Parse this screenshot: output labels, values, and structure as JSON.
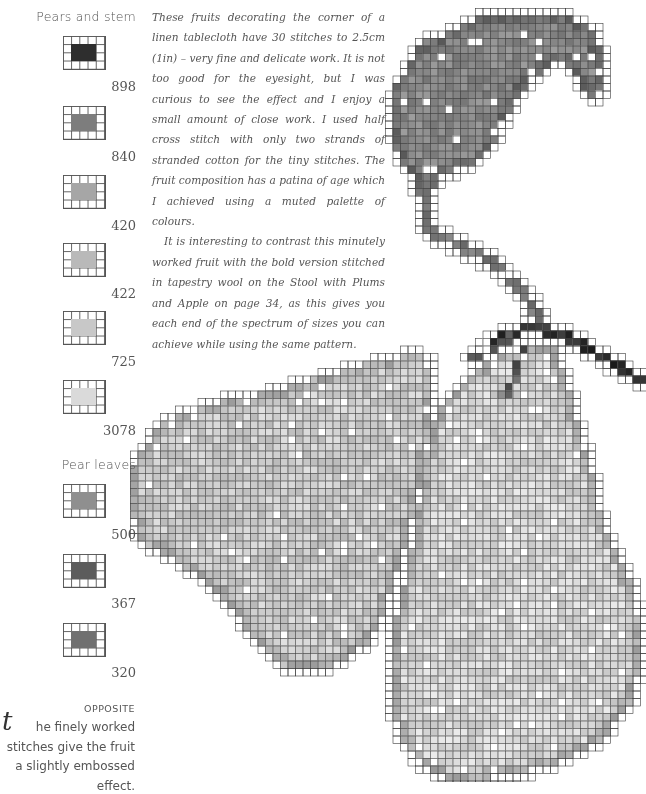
{
  "legend": {
    "sections": [
      {
        "heading": "Pears and stem",
        "swatches": [
          {
            "code": "898",
            "color": "#2e2e2e"
          },
          {
            "code": "840",
            "color": "#7d7d7d"
          },
          {
            "code": "420",
            "color": "#a6a6a6"
          },
          {
            "code": "422",
            "color": "#b9b9b9"
          },
          {
            "code": "725",
            "color": "#c8c8c8"
          },
          {
            "code": "3078",
            "color": "#dadada"
          }
        ]
      },
      {
        "heading": "Pear leaves",
        "swatches": [
          {
            "code": "500",
            "color": "#8f8f8f"
          },
          {
            "code": "367",
            "color": "#5c5c5c"
          },
          {
            "code": "320",
            "color": "#707070"
          }
        ]
      }
    ]
  },
  "body": {
    "paragraphs": [
      "These fruits decorating the corner of a linen tablecloth have 30 stitches to 2.5cm (1in) – very fine and delicate work. It is not too good for the eyesight, but I was curious to see the effect and I enjoy a small amount of close work. I used half cross stitch with only two strands of stranded cotton for the tiny stitches. The fruit composition has a patina of age which I achieved using a muted palette of colours.",
      "It is interesting to contrast this minutely worked fruit with the bold version stitched in tapestry wool on the Stool with Plums and Apple on page 34, as this gives you each end of the spectrum of sizes you can achieve while using the same pattern."
    ]
  },
  "caption": {
    "label": "OPPOSITE",
    "dropcap": "t",
    "text": "he finely worked stitches give the fruit a slightly embossed effect."
  },
  "chart": {
    "cell": 7.5,
    "grid_color": "#3a3a3a",
    "regions": [
      {
        "name": "leaf",
        "fill": "#8a8a8a",
        "dark": "#4a4a4a",
        "points": [
          [
            395,
            90
          ],
          [
            420,
            45
          ],
          [
            480,
            18
          ],
          [
            545,
            12
          ],
          [
            590,
            25
          ],
          [
            600,
            55
          ],
          [
            600,
            95
          ],
          [
            590,
            95
          ],
          [
            565,
            60
          ],
          [
            545,
            65
          ],
          [
            520,
            90
          ],
          [
            505,
            115
          ],
          [
            490,
            150
          ],
          [
            470,
            165
          ],
          [
            450,
            170
          ],
          [
            435,
            175
          ],
          [
            430,
            200
          ],
          [
            420,
            200
          ],
          [
            415,
            175
          ],
          [
            400,
            165
          ],
          [
            395,
            140
          ]
        ]
      },
      {
        "name": "left-pear",
        "fill": "#cdcdcd",
        "dark": "#8a8a8a",
        "points": [
          [
            135,
            460
          ],
          [
            160,
            425
          ],
          [
            205,
            405
          ],
          [
            260,
            395
          ],
          [
            330,
            375
          ],
          [
            390,
            358
          ],
          [
            425,
            355
          ],
          [
            430,
            420
          ],
          [
            420,
            480
          ],
          [
            405,
            540
          ],
          [
            390,
            590
          ],
          [
            370,
            640
          ],
          [
            330,
            665
          ],
          [
            290,
            670
          ],
          [
            255,
            640
          ],
          [
            225,
            600
          ],
          [
            200,
            575
          ],
          [
            170,
            555
          ],
          [
            140,
            540
          ],
          [
            130,
            500
          ]
        ]
      },
      {
        "name": "right-pear",
        "fill": "#d8d8d8",
        "dark": "#7a7a7a",
        "points": [
          [
            430,
            430
          ],
          [
            450,
            395
          ],
          [
            490,
            360
          ],
          [
            530,
            345
          ],
          [
            555,
            350
          ],
          [
            565,
            380
          ],
          [
            575,
            420
          ],
          [
            590,
            470
          ],
          [
            600,
            520
          ],
          [
            620,
            560
          ],
          [
            635,
            600
          ],
          [
            640,
            660
          ],
          [
            630,
            700
          ],
          [
            600,
            740
          ],
          [
            560,
            760
          ],
          [
            510,
            775
          ],
          [
            450,
            778
          ],
          [
            420,
            765
          ],
          [
            400,
            735
          ],
          [
            390,
            690
          ],
          [
            395,
            620
          ],
          [
            410,
            560
          ],
          [
            420,
            500
          ]
        ]
      }
    ],
    "stems": [
      {
        "name": "upper-stem",
        "color": "#7a7a7a",
        "width": 8,
        "points": [
          [
            425,
            190
          ],
          [
            430,
            230
          ],
          [
            460,
            245
          ],
          [
            500,
            265
          ],
          [
            520,
            290
          ],
          [
            535,
            310
          ],
          [
            545,
            330
          ]
        ]
      },
      {
        "name": "branch-stem",
        "color": "#2f2f2f",
        "width": 8,
        "points": [
          [
            485,
            345
          ],
          [
            520,
            330
          ],
          [
            545,
            330
          ],
          [
            575,
            340
          ],
          [
            600,
            355
          ],
          [
            625,
            370
          ],
          [
            640,
            380
          ]
        ]
      },
      {
        "name": "left-pear-stem",
        "color": "#555555",
        "width": 7,
        "points": [
          [
            470,
            360
          ],
          [
            500,
            345
          ],
          [
            510,
            335
          ]
        ]
      },
      {
        "name": "right-pear-stem",
        "color": "#555555",
        "width": 7,
        "points": [
          [
            505,
            395
          ],
          [
            515,
            375
          ],
          [
            525,
            350
          ]
        ]
      }
    ]
  }
}
